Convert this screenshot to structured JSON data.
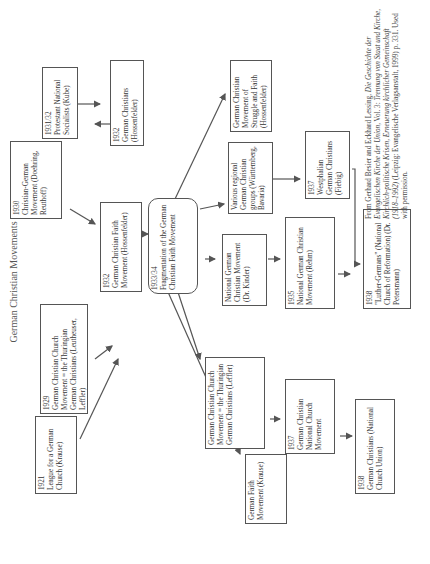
{
  "title": "German Christian Movements",
  "nodes": {
    "n1921": {
      "year": "1921",
      "label": "League for a German Church (Krause)"
    },
    "n1929": {
      "year": "1929",
      "label": "German Christian Church Movement = the Thuringian German Christians (Leutheuser, Leffler)"
    },
    "n1930": {
      "year": "1930",
      "label": "Christian-German Movement (Doehring, Reuthoff)"
    },
    "n1931": {
      "year": "1931/32",
      "label": "Protestant National Socialists (Kube)"
    },
    "n1932a": {
      "year": "1932",
      "label": "German Christians (Hossenfelder)"
    },
    "n1932b": {
      "year": "1932",
      "label": "German Christian Faith Movement (Hossenfelder)"
    },
    "n1933": {
      "year": "1933/34",
      "label": "Fragmentation of the German Christian Faith Movement"
    },
    "faith": {
      "year": "",
      "label": "German Faith Movement (Krause)"
    },
    "gccm": {
      "year": "",
      "label": "German Christian Church Movement = the Thuringian German Christians (Leffler)"
    },
    "ngcm": {
      "year": "",
      "label": "National German Christian Movement (Dr. Kinder)"
    },
    "regional": {
      "year": "",
      "label": "Various regional German Christian groups (Württemberg, Bavaria)"
    },
    "struggle": {
      "year": "",
      "label": "German Christian Movement of Struggle and Faith (Hossenfelder)"
    },
    "n1937a": {
      "year": "1937",
      "label": "German Christian National Church Movement"
    },
    "n1935": {
      "year": "1935",
      "label": "National German Christian Movement (Rehm)"
    },
    "n1937b": {
      "year": "1937",
      "label": "Westphalian German Christians (Fiebig)"
    },
    "n1938a": {
      "year": "1938",
      "label": "German Christians (National Church Union)"
    },
    "n1938b": {
      "year": "1938",
      "label": "\"Luther-Germans\" (National Church of Reformation) (Dr. Petersmann)"
    }
  },
  "citation": {
    "prefix": "From Gerhard Besier and Eckhard Lessing, ",
    "book": "Die Geschichte der Evangelischen Kirche der Union",
    "vol": ", Vol. 3: ",
    "subtitle": "Trennung von Staat und Kirche, Kirchlich-politische Krisen, Erneuerung kirchlicher Gemeinschaft (1918–1992)",
    "suffix": " (Leipzig: Evangelische Verlagsanstalt, 1999) p. 331. Used with permission."
  }
}
